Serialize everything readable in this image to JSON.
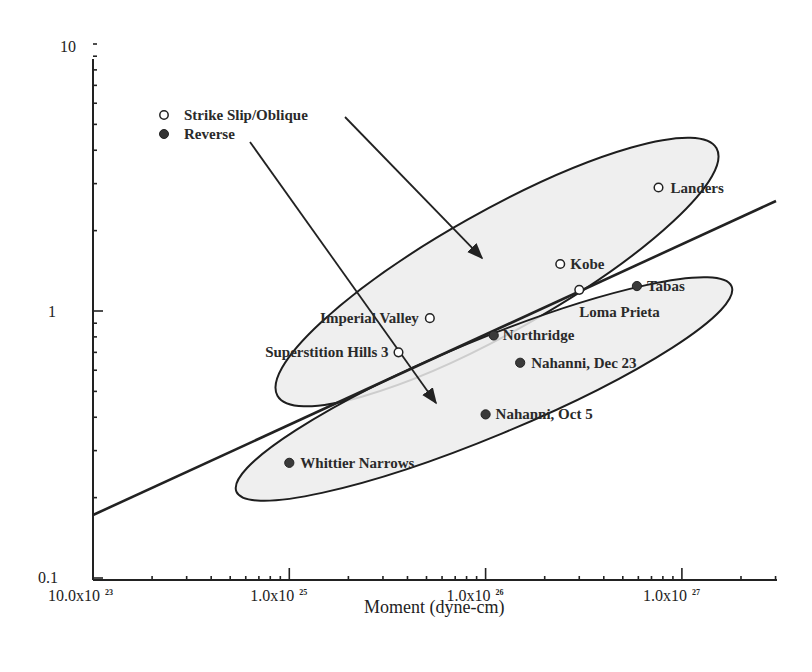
{
  "chart_data": {
    "type": "scatter",
    "title": "",
    "xlabel": "Moment (dyne-cm)",
    "ylabel": "",
    "xscale": "log",
    "yscale": "log",
    "xlim": [
      1e+24,
      3.2e+27
    ],
    "ylim": [
      0.1,
      10
    ],
    "x_ticks": [
      {
        "value": 1e+24,
        "mantissa": "10.0x10",
        "exp": "23"
      },
      {
        "value": 1e+25,
        "mantissa": "1.0x10",
        "exp": "25"
      },
      {
        "value": 1e+26,
        "mantissa": "1.0x10",
        "exp": "26"
      },
      {
        "value": 1e+27,
        "mantissa": "1.0x10",
        "exp": "27"
      }
    ],
    "y_ticks": [
      {
        "value": 0.1,
        "label": "0.1"
      },
      {
        "value": 1,
        "label": "1"
      },
      {
        "value": 10,
        "label": "10"
      }
    ],
    "grid": false,
    "legend": {
      "position": "upper-left",
      "entries": [
        {
          "name": "Strike Slip/Oblique",
          "marker": "open-circle"
        },
        {
          "name": "Reverse",
          "marker": "filled-circle"
        }
      ]
    },
    "series": [
      {
        "name": "Strike Slip/Oblique",
        "marker": "open-circle",
        "points": [
          {
            "label": "Landers",
            "x": 7.6e+26,
            "y": 2.9
          },
          {
            "label": "Kobe",
            "x": 2.4e+26,
            "y": 1.5
          },
          {
            "label": "Loma Prieta",
            "x": 3e+26,
            "y": 1.2
          },
          {
            "label": "Imperial Valley",
            "x": 5.2e+25,
            "y": 0.94
          },
          {
            "label": "Superstition Hills 3",
            "x": 3.6e+25,
            "y": 0.7
          }
        ]
      },
      {
        "name": "Reverse",
        "marker": "filled-circle",
        "points": [
          {
            "label": "Tabas",
            "x": 5.9e+26,
            "y": 1.24
          },
          {
            "label": "Northridge",
            "x": 1.1e+26,
            "y": 0.81
          },
          {
            "label": "Nahanni, Dec 23",
            "x": 1.5e+26,
            "y": 0.64
          },
          {
            "label": "Nahanni, Oct 5",
            "x": 1e+26,
            "y": 0.41
          },
          {
            "label": "Whittier Narrows",
            "x": 1e+25,
            "y": 0.27
          }
        ]
      }
    ],
    "regression_line": {
      "x": [
        1e+24,
        3.2e+27
      ],
      "y": [
        0.175,
        2.35
      ]
    },
    "annotations": [
      "Shaded ellipse enclosing Strike Slip/Oblique events, with arrow from legend entry",
      "Shaded ellipse enclosing Reverse events, with arrow from legend entry"
    ]
  }
}
